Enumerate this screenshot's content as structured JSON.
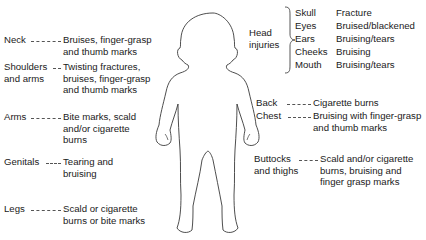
{
  "left_labels": [
    {
      "region": "Neck",
      "injury": "Bruises, finger-grasp and thumb marks"
    },
    {
      "region": "Shoulders and arms",
      "region_line1": "Shoulders",
      "region_line2": "and arms",
      "injury": "Twisting fractures, bruises, finger-grasp and thumb marks"
    },
    {
      "region": "Arms",
      "injury": "Bite marks, scald and/or cigarette burns"
    },
    {
      "region": "Genitals",
      "injury": "Tearing and bruising"
    },
    {
      "region": "Legs",
      "injury": "Scald or cigarette burns or bite marks"
    }
  ],
  "head": {
    "label_line1": "Head",
    "label_line2": "injuries",
    "items": [
      {
        "part": "Skull",
        "injury": "Fracture"
      },
      {
        "part": "Eyes",
        "injury": "Bruised/blackened"
      },
      {
        "part": "Ears",
        "injury": "Bruising/tears"
      },
      {
        "part": "Cheeks",
        "injury": "Bruising"
      },
      {
        "part": "Mouth",
        "injury": "Bruising/tears"
      }
    ]
  },
  "right_labels": [
    {
      "region": "Back",
      "injury": "Cigarette burns"
    },
    {
      "region": "Chest",
      "injury": "Bruising with finger-grasp and thumb marks"
    },
    {
      "region": "Buttocks and thighs",
      "region_line1": "Buttocks",
      "region_line2": "and thighs",
      "injury": "Scald and/or cigarette burns, bruising and finger grasp marks"
    }
  ],
  "colors": {
    "text": "#1a1a1a",
    "outline": "#333333",
    "background": "#ffffff"
  }
}
